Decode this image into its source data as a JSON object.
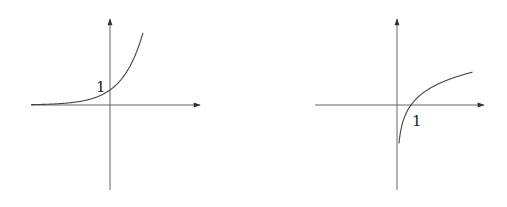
{
  "chart_data": [
    {
      "type": "line",
      "title": "",
      "function": "exponential",
      "xlabel": "",
      "ylabel": "",
      "annotations": [
        {
          "text": "1",
          "at": "y-intercept",
          "x": 0,
          "y": 1
        }
      ],
      "xlim": [
        -4,
        2
      ],
      "ylim": [
        -4,
        4
      ],
      "series": [
        {
          "name": "exponential",
          "x": [
            -3.8,
            -3,
            -2,
            -1,
            0,
            0.5,
            1,
            1.2
          ],
          "y": [
            0.02,
            0.05,
            0.14,
            0.37,
            1,
            1.65,
            2.72,
            3.3
          ]
        }
      ],
      "grid": false,
      "legend": null
    },
    {
      "type": "line",
      "title": "",
      "function": "logarithm",
      "xlabel": "",
      "ylabel": "",
      "annotations": [
        {
          "text": "1",
          "at": "x-intercept",
          "x": 1,
          "y": 0
        }
      ],
      "xlim": [
        -3,
        3
      ],
      "ylim": [
        -3,
        3
      ],
      "series": [
        {
          "name": "logarithm",
          "x": [
            0.05,
            0.1,
            0.25,
            0.5,
            1,
            2,
            3,
            4
          ],
          "y": [
            -3,
            -2.3,
            -1.39,
            -0.69,
            0,
            0.69,
            1.1,
            1.39
          ]
        }
      ],
      "grid": false,
      "legend": null
    }
  ]
}
